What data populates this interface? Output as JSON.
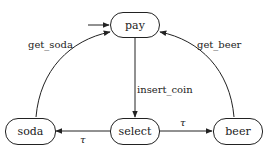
{
  "diagram": {
    "type": "state-machine",
    "initial_state": "pay",
    "states": [
      {
        "id": "pay",
        "label": "pay"
      },
      {
        "id": "select",
        "label": "select"
      },
      {
        "id": "soda",
        "label": "soda"
      },
      {
        "id": "beer",
        "label": "beer"
      }
    ],
    "transitions": [
      {
        "from": "pay",
        "to": "select",
        "label": "insert_coin"
      },
      {
        "from": "select",
        "to": "soda",
        "label": "τ"
      },
      {
        "from": "select",
        "to": "beer",
        "label": "τ"
      },
      {
        "from": "soda",
        "to": "pay",
        "label": "get_soda"
      },
      {
        "from": "beer",
        "to": "pay",
        "label": "get_beer"
      }
    ]
  },
  "labels": {
    "pay": "pay",
    "select": "select",
    "soda": "soda",
    "beer": "beer",
    "insert_coin": "insert_coin",
    "tau_soda": "τ",
    "tau_beer": "τ",
    "get_soda": "get_soda",
    "get_beer": "get_beer"
  }
}
